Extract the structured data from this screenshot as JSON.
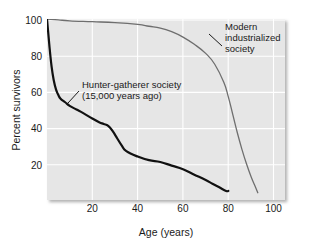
{
  "chart_data": {
    "type": "line",
    "title": "",
    "xlabel": "Age (years)",
    "ylabel": "Percent survivors",
    "xlim": [
      0,
      105
    ],
    "ylim": [
      0,
      100
    ],
    "xticks": [
      "20",
      "40",
      "60",
      "80",
      "100"
    ],
    "xtick_values": [
      20,
      40,
      60,
      80,
      100
    ],
    "yticks": [
      "20",
      "40",
      "60",
      "80",
      "100"
    ],
    "ytick_values": [
      20,
      40,
      60,
      80,
      100
    ],
    "grid": true,
    "grid_color": "#ffffff",
    "plot_background": "#e6e6e6",
    "legend": "none",
    "annotations": [
      {
        "name": "hunter-gatherer-label",
        "line1": "Hunter-gatherer society",
        "line2": "(15,000 years ago)",
        "leader_from": [
          13,
          58
        ],
        "leader_to": [
          8.5,
          49
        ]
      },
      {
        "name": "modern-label",
        "line1": "Modern",
        "line2": "industrialized",
        "line3": "society",
        "leader_from": [
          76,
          90
        ],
        "leader_to": [
          70,
          95
        ]
      }
    ],
    "series": [
      {
        "name": "Hunter-gatherer society (15,000 years ago)",
        "color": "#111111",
        "linewidth": 2.2,
        "x": [
          0,
          1,
          2,
          3,
          4,
          5,
          6,
          8,
          10,
          13,
          16,
          20,
          23,
          25,
          27,
          29,
          31,
          33,
          35,
          40,
          45,
          50,
          55,
          60,
          65,
          70,
          73,
          76,
          79,
          80
        ],
        "y": [
          100,
          86,
          74,
          66,
          61,
          58,
          56,
          54,
          52,
          50,
          48,
          45,
          43,
          42,
          41,
          38,
          34,
          30,
          27,
          24,
          22,
          21,
          19,
          17,
          14,
          11,
          9,
          7,
          5,
          5
        ]
      },
      {
        "name": "Modern industrialized society",
        "color": "#6e6e6e",
        "linewidth": 1.3,
        "x": [
          0,
          5,
          10,
          20,
          30,
          40,
          45,
          50,
          55,
          60,
          65,
          70,
          74,
          78,
          80,
          82,
          84,
          86,
          88,
          90,
          92,
          93
        ],
        "y": [
          100,
          99.5,
          99,
          98.5,
          98,
          97,
          96,
          95,
          93,
          90,
          86,
          81,
          75,
          65,
          57,
          47,
          37,
          28,
          20,
          13,
          7,
          4
        ]
      }
    ]
  },
  "axes": {
    "y_title": "Percent survivors",
    "x_title": "Age (years)"
  }
}
